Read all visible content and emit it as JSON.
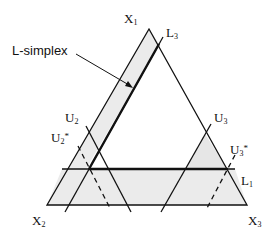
{
  "diagram": {
    "annotation": "L-simplex",
    "colors": {
      "line": "#111111",
      "shade": "#e9e9e9",
      "background": "#ffffff"
    },
    "vertices": [
      {
        "name": "X",
        "sub": "1"
      },
      {
        "name": "X",
        "sub": "2"
      },
      {
        "name": "X",
        "sub": "3"
      }
    ],
    "lines": [
      {
        "name": "L",
        "sub": "3",
        "star": ""
      },
      {
        "name": "L",
        "sub": "1",
        "star": ""
      },
      {
        "name": "U",
        "sub": "2",
        "star": ""
      },
      {
        "name": "U",
        "sub": "2",
        "star": "*"
      },
      {
        "name": "U",
        "sub": "3",
        "star": ""
      },
      {
        "name": "U",
        "sub": "3",
        "star": "*"
      }
    ]
  }
}
